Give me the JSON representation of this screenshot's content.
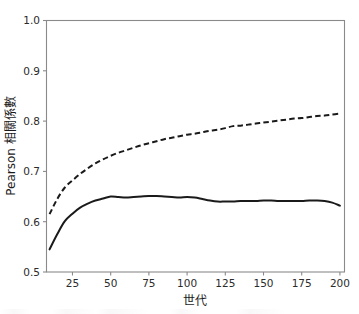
{
  "chart_data": {
    "type": "line",
    "title": "",
    "xlabel": "世代",
    "ylabel": "Pearson 相關係數",
    "xlim": [
      8,
      203
    ],
    "ylim": [
      0.5,
      1.0
    ],
    "grid": false,
    "legend": "none",
    "xticks": [
      25,
      50,
      75,
      100,
      125,
      150,
      175,
      200
    ],
    "xtick_labels": [
      "25",
      "50",
      "75",
      "100",
      "125",
      "150",
      "175",
      "200"
    ],
    "yticks": [
      0.5,
      0.6,
      0.7,
      0.8,
      0.9,
      1.0
    ],
    "ytick_labels": [
      "0.5",
      "0.6",
      "0.7",
      "0.8",
      "0.9",
      "1.0"
    ],
    "x": [
      10,
      15,
      20,
      25,
      30,
      35,
      40,
      45,
      50,
      55,
      60,
      65,
      70,
      75,
      80,
      85,
      90,
      95,
      100,
      105,
      110,
      115,
      120,
      125,
      130,
      135,
      140,
      145,
      150,
      155,
      160,
      165,
      170,
      175,
      180,
      185,
      190,
      195,
      200
    ],
    "series": [
      {
        "name": "solid-series",
        "style": "solid",
        "color": "#1a1a1a",
        "values": [
          0.545,
          0.575,
          0.601,
          0.616,
          0.628,
          0.636,
          0.642,
          0.646,
          0.65,
          0.649,
          0.648,
          0.649,
          0.65,
          0.651,
          0.651,
          0.65,
          0.649,
          0.648,
          0.649,
          0.648,
          0.645,
          0.642,
          0.64,
          0.64,
          0.64,
          0.641,
          0.641,
          0.641,
          0.642,
          0.642,
          0.641,
          0.641,
          0.641,
          0.641,
          0.642,
          0.642,
          0.641,
          0.638,
          0.632
        ]
      },
      {
        "name": "dashed-series",
        "style": "dashed",
        "color": "#1a1a1a",
        "values": [
          0.615,
          0.645,
          0.668,
          0.682,
          0.695,
          0.706,
          0.716,
          0.724,
          0.731,
          0.737,
          0.742,
          0.747,
          0.752,
          0.756,
          0.76,
          0.764,
          0.767,
          0.77,
          0.773,
          0.775,
          0.778,
          0.781,
          0.783,
          0.786,
          0.79,
          0.791,
          0.793,
          0.795,
          0.797,
          0.799,
          0.801,
          0.803,
          0.805,
          0.806,
          0.808,
          0.81,
          0.811,
          0.813,
          0.815
        ]
      }
    ]
  },
  "figure": {
    "background_color": "#ffffff",
    "frame_color": "#8a8a8a",
    "line_color": "#1a1a1a"
  }
}
